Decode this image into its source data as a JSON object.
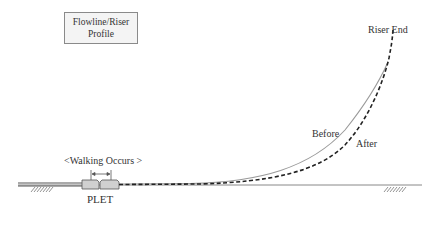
{
  "title_box": {
    "line1": "Flowline/Riser",
    "line2": "Profile"
  },
  "labels": {
    "riser_end": "Riser End",
    "before": "Before",
    "after": "After",
    "walking": "<Walking Occurs >",
    "plet": "PLET"
  },
  "colors": {
    "before_curve": "#9a9a9a",
    "after_curve": "#222222",
    "seabed": "#888888",
    "plet_fill": "#d0d0d0",
    "plet_stroke": "#555555",
    "title_box_fill": "#f4f4f4"
  },
  "icons": [
    "seabed-hatch-left",
    "seabed-hatch-right",
    "walking-arrow"
  ]
}
